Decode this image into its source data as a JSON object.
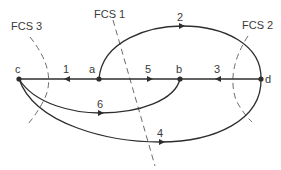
{
  "diagram": {
    "type": "directed-graph-with-cutsets",
    "nodes": [
      {
        "id": "c",
        "label": "c"
      },
      {
        "id": "a",
        "label": "a"
      },
      {
        "id": "b",
        "label": "b"
      },
      {
        "id": "d",
        "label": "d"
      }
    ],
    "edges": [
      {
        "id": "1",
        "label": "1",
        "from": "a",
        "to": "c"
      },
      {
        "id": "2",
        "label": "2",
        "from": "a",
        "to": "d"
      },
      {
        "id": "3",
        "label": "3",
        "from": "d",
        "to": "b"
      },
      {
        "id": "4",
        "label": "4",
        "from": "c",
        "to": "d"
      },
      {
        "id": "5",
        "label": "5",
        "from": "a",
        "to": "b"
      },
      {
        "id": "6",
        "label": "6",
        "from": "c",
        "to": "b"
      }
    ],
    "cutsets": [
      {
        "id": "fcs1",
        "label": "FCS 1"
      },
      {
        "id": "fcs2",
        "label": "FCS 2"
      },
      {
        "id": "fcs3",
        "label": "FCS 3"
      }
    ]
  }
}
